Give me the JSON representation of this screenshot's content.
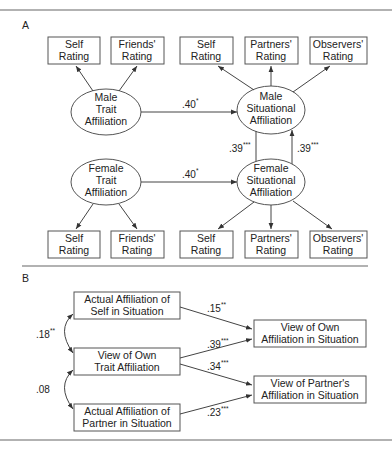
{
  "panel_a": {
    "label": "A",
    "male_trait": {
      "lines": [
        "Male",
        "Trait",
        "Affiliation"
      ]
    },
    "male_situational": {
      "lines": [
        "Male",
        "Situational",
        "Affiliation"
      ]
    },
    "female_trait": {
      "lines": [
        "Female",
        "Trait",
        "Affiliation"
      ]
    },
    "female_situational": {
      "lines": [
        "Female",
        "Situational",
        "Affiliation"
      ]
    },
    "male_trait_indicators": [
      {
        "lines": [
          "Self",
          "Rating"
        ]
      },
      {
        "lines": [
          "Friends'",
          "Rating"
        ]
      }
    ],
    "male_sit_indicators": [
      {
        "lines": [
          "Self",
          "Rating"
        ]
      },
      {
        "lines": [
          "Partners'",
          "Rating"
        ]
      },
      {
        "lines": [
          "Observers'",
          "Rating"
        ]
      }
    ],
    "female_trait_indicators": [
      {
        "lines": [
          "Self",
          "Rating"
        ]
      },
      {
        "lines": [
          "Friends'",
          "Rating"
        ]
      }
    ],
    "female_sit_indicators": [
      {
        "lines": [
          "Self",
          "Rating"
        ]
      },
      {
        "lines": [
          "Partners'",
          "Rating"
        ]
      },
      {
        "lines": [
          "Observers'",
          "Rating"
        ]
      }
    ],
    "paths": {
      "male_trait_to_sit": {
        "value": ".40",
        "sig": "*"
      },
      "female_trait_to_sit": {
        "value": ".40",
        "sig": "*"
      },
      "male_sit_to_female_sit": {
        "value": ".39",
        "sig": "***"
      },
      "female_sit_to_male_sit": {
        "value": ".39",
        "sig": "***"
      }
    }
  },
  "panel_b": {
    "label": "B",
    "actual_self": {
      "lines": [
        "Actual Affiliation of",
        "Self in Situation"
      ]
    },
    "view_own_trait": {
      "lines": [
        "View of Own",
        "Trait Affiliation"
      ]
    },
    "actual_partner": {
      "lines": [
        "Actual Affiliation of",
        "Partner in Situation"
      ]
    },
    "view_own_sit": {
      "lines": [
        "View of Own",
        "Affiliation in Situation"
      ]
    },
    "view_partner_sit": {
      "lines": [
        "View of Partner's",
        "Affiliation in Situation"
      ]
    },
    "correlations": {
      "self_trait": {
        "value": ".18",
        "sig": "**"
      },
      "trait_partner": {
        "value": ".08",
        "sig": ""
      }
    },
    "paths": {
      "self_to_own": {
        "value": ".15",
        "sig": "**"
      },
      "trait_to_own": {
        "value": ".39",
        "sig": "***"
      },
      "trait_to_partner": {
        "value": ".34",
        "sig": "***"
      },
      "partner_to_partner": {
        "value": ".23",
        "sig": "***"
      }
    }
  }
}
